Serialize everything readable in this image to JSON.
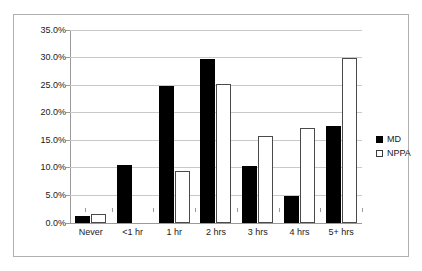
{
  "figure": {
    "top_cut_text": "",
    "frame_color": "#b0b0b0"
  },
  "legend": {
    "position": "right",
    "entries": [
      {
        "label": "MD",
        "swatch": "filled-black-square"
      },
      {
        "label": "NPPA",
        "swatch": "open-white-square"
      }
    ]
  },
  "chart_data": {
    "type": "bar",
    "title": "",
    "xlabel": "",
    "ylabel": "",
    "ylim": [
      0,
      35
    ],
    "ytick_values": [
      0,
      5,
      10,
      15,
      20,
      25,
      30,
      35
    ],
    "ytick_labels": [
      "0.0%",
      "5.0%",
      "10.0%",
      "15.0%",
      "20.0%",
      "25.0%",
      "30.0%",
      "35.0%"
    ],
    "grid": true,
    "legend_position": "right",
    "categories": [
      "Never",
      "<1 hr",
      "1 hr",
      "2 hrs",
      "3 hrs",
      "4 hrs",
      "5+ hrs"
    ],
    "series": [
      {
        "name": "MD",
        "color": "#000000",
        "values": [
          1.2,
          10.5,
          24.8,
          29.8,
          10.4,
          4.9,
          17.6
        ]
      },
      {
        "name": "NPPA",
        "color": "#ffffff",
        "edgecolor": "#4a4a4a",
        "values": [
          1.7,
          0.0,
          9.4,
          25.3,
          15.7,
          17.3,
          30.0
        ]
      }
    ]
  }
}
